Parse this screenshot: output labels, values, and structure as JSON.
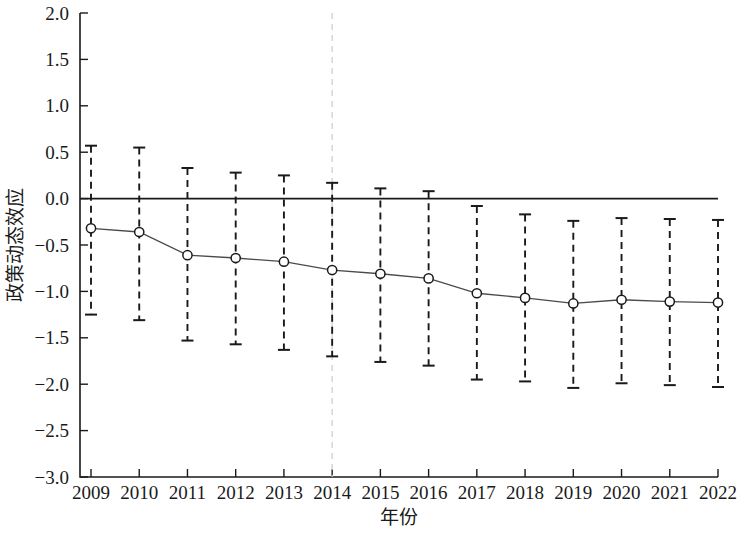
{
  "chart_data": {
    "type": "line",
    "title": "",
    "subtitle": "",
    "xlabel": "年份",
    "ylabel": "政策动态效应",
    "x": [
      2009,
      2010,
      2011,
      2012,
      2013,
      2014,
      2015,
      2016,
      2017,
      2018,
      2019,
      2020,
      2021,
      2022
    ],
    "xtick_labels": [
      "2009",
      "2010",
      "2011",
      "2012",
      "2013",
      "2014",
      "2015",
      "2016",
      "2017",
      "2018",
      "2019",
      "2020",
      "2021",
      "2022"
    ],
    "ytick_labels": [
      "2.0",
      "1.5",
      "1.0",
      "0.5",
      "0.0",
      "-0.5",
      "-1.0",
      "-1.5",
      "-2.0",
      "-2.5",
      "-3.0"
    ],
    "ytick_values": [
      2.0,
      1.5,
      1.0,
      0.5,
      0.0,
      -0.5,
      -1.0,
      -1.5,
      -2.0,
      -2.5,
      -3.0
    ],
    "ylim": [
      -3.0,
      2.0
    ],
    "xlim": [
      2008.5,
      2022.5
    ],
    "grid": false,
    "legend": "none",
    "series": [
      {
        "name": "政策动态效应",
        "marker": "circle-open",
        "values": [
          -0.32,
          -0.36,
          -0.61,
          -0.64,
          -0.68,
          -0.77,
          -0.81,
          -0.86,
          -1.02,
          -1.07,
          -1.13,
          -1.09,
          -1.11,
          -1.12
        ],
        "ci_upper": [
          0.57,
          0.55,
          0.33,
          0.28,
          0.25,
          0.17,
          0.11,
          0.08,
          -0.08,
          -0.17,
          -0.24,
          -0.21,
          -0.22,
          -0.23
        ],
        "ci_lower": [
          -1.25,
          -1.31,
          -1.53,
          -1.57,
          -1.63,
          -1.7,
          -1.76,
          -1.8,
          -1.95,
          -1.97,
          -2.04,
          -1.99,
          -2.01,
          -2.03
        ]
      }
    ],
    "annotations": [
      {
        "name": "policy-reference-line",
        "type": "vline",
        "x": 2014,
        "style": "dashed",
        "color": "#cfcfcf"
      },
      {
        "name": "zero-reference-line",
        "type": "hline",
        "y": 0.0,
        "style": "solid",
        "color": "#1a1a1a"
      }
    ]
  },
  "colors": {
    "axis": "#1a1a1a",
    "series": "#4a4a4a",
    "errorbar": "#1a1a1a",
    "reference": "#cfcfcf",
    "background": "#ffffff"
  }
}
